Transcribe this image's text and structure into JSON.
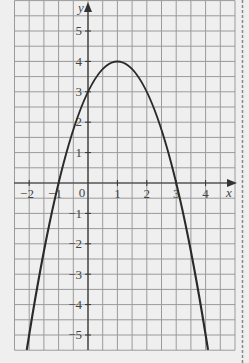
{
  "chart_data": {
    "type": "line",
    "title": "",
    "function": "y = -x^2 + 2x + 3",
    "xlabel": "x",
    "ylabel": "y",
    "xlim": [
      -2.5,
      5
    ],
    "ylim": [
      -5.5,
      6
    ],
    "grid": true,
    "grid_step": 0.5,
    "x_ticks": [
      -2,
      -1,
      0,
      1,
      2,
      3,
      4
    ],
    "y_ticks": [
      -5,
      -4,
      -3,
      -2,
      -1,
      1,
      2,
      3,
      4,
      5
    ],
    "x_tick_labels": [
      "−2",
      "−1",
      "0",
      "1",
      "2",
      "3",
      "4"
    ],
    "y_tick_labels": [
      "−5",
      "−4",
      "−3",
      "−2",
      "−1",
      "1",
      "2",
      "3",
      "4",
      "5"
    ],
    "series": [
      {
        "name": "parabola",
        "x": [
          -2.08,
          -2,
          -1,
          0,
          1,
          2,
          3,
          4,
          4.08
        ],
        "y": [
          -5.49,
          -5,
          0,
          3,
          4,
          3,
          0,
          -5,
          -5.49
        ]
      }
    ],
    "key_points": {
      "vertex": [
        1,
        4
      ],
      "x_intercepts": [
        -1,
        3
      ],
      "y_intercept": 3
    },
    "colors": {
      "background": "#efefef",
      "grid": "#9a9a9a",
      "axis": "#333333",
      "curve": "#2a2a2a"
    }
  },
  "labels": {
    "x_axis": "x",
    "y_axis": "y",
    "x_ticks": {
      "m2": "−2",
      "m1": "−1",
      "zero": "0",
      "p1": "1",
      "p2": "2",
      "p3": "3",
      "p4": "4"
    },
    "y_ticks": {
      "p5": "5",
      "p4": "4",
      "p3": "3",
      "p2": "2",
      "p1": "1",
      "m1": "−1",
      "m2": "−2",
      "m3": "−3",
      "m4": "−4",
      "m5": "−5"
    }
  }
}
